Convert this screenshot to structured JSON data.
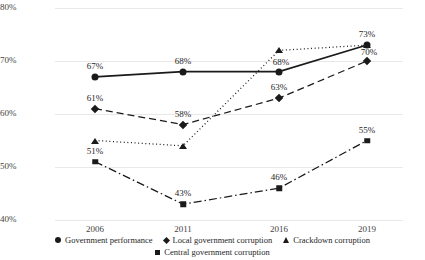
{
  "chart_data": {
    "type": "line",
    "title": "",
    "xlabel": "",
    "ylabel": "",
    "categories": [
      "2006",
      "2011",
      "2016",
      "2019"
    ],
    "ylim": [
      40,
      80
    ],
    "yticks": [
      "40%",
      "50%",
      "60%",
      "70%",
      "80%"
    ],
    "ytick_values": [
      40,
      50,
      60,
      70,
      80
    ],
    "grid": true,
    "legend_position": "bottom",
    "series": [
      {
        "name": "Government performance",
        "marker": "circle",
        "linestyle": "solid",
        "values": [
          67,
          68,
          68,
          73
        ],
        "labels": [
          "67%",
          "68%",
          "68%",
          "73%"
        ]
      },
      {
        "name": "Local government corruption",
        "marker": "diamond",
        "linestyle": "dashed",
        "values": [
          61,
          58,
          63,
          70
        ],
        "labels": [
          "61%",
          "58%",
          "63%",
          "70%"
        ]
      },
      {
        "name": "Crackdown corruption",
        "marker": "triangle",
        "linestyle": "dotted",
        "values": [
          55,
          54,
          72,
          73
        ],
        "labels": [
          "",
          "",
          "",
          ""
        ]
      },
      {
        "name": "Central government corruption",
        "marker": "square",
        "linestyle": "dashdot",
        "values": [
          51,
          43,
          46,
          55
        ],
        "labels": [
          "51%",
          "43%",
          "46%",
          "55%"
        ]
      }
    ]
  },
  "colors": {
    "line": "#1a1a1a",
    "grid": "#e8e8e8",
    "text": "#262626"
  }
}
